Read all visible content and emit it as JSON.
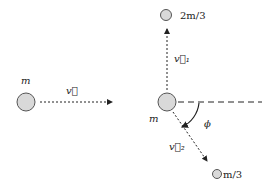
{
  "diagram": {
    "type": "collision-decay",
    "incoming": {
      "mass_label": "m",
      "velocity_label": "v⃗"
    },
    "center": {
      "mass_label": "m"
    },
    "fragment1": {
      "mass_label": "2m/3",
      "velocity_label": "v⃗₁"
    },
    "fragment2": {
      "mass_label": "m/3",
      "velocity_label": "v⃗₂"
    },
    "angle_label": "ϕ",
    "colors": {
      "ball_fill": "#d9d9d9",
      "ball_stroke": "#555555",
      "line": "#222222"
    }
  }
}
